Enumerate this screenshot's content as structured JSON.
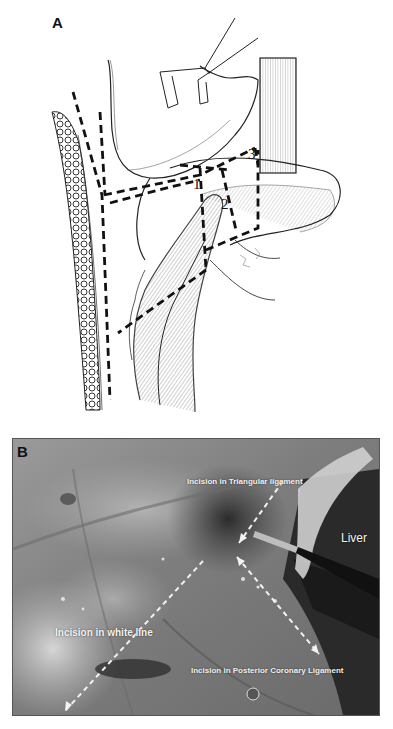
{
  "figure": {
    "panel_a": {
      "label": "A",
      "type": "surgical illustration",
      "region_numbers": [
        "1",
        "2",
        "3"
      ]
    },
    "panel_b": {
      "label": "B",
      "type": "intraoperative photograph (grayscale)",
      "annotations": {
        "triangular": "Incision in Triangular ligament",
        "liver": "Liver",
        "white_line": "Incision in white line",
        "posterior": "Incision in Posterior Coronary Ligament"
      }
    }
  },
  "colors": {
    "background": "#ffffff",
    "ink": "#111111",
    "annotation_text": "#f2f2f2",
    "photo_border": "#555555"
  }
}
